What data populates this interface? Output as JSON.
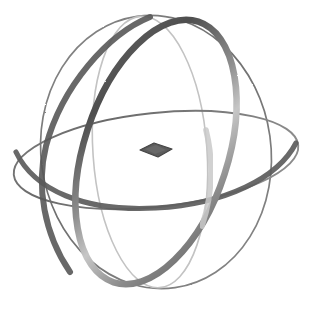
{
  "figure": {
    "background_color": "#ffffff",
    "width": 314,
    "height": 315,
    "center": {
      "x": 156,
      "y": 152
    }
  },
  "palette": {
    "background": "#ffffff",
    "thick_ring_dark": "#5a5a5a",
    "thick_ring_mid": "#7d7d7d",
    "thick_ring_light": "#b9b9b9",
    "outline_circle": "#7a7a7a",
    "faint_ring": "#c3c3c3",
    "equator_ring": "#6e6e6e",
    "center_marker": "#5b5b5b",
    "center_marker_edge": "#454545"
  },
  "elements": {
    "outer_sphere_outline": {
      "name": "Sphere silhouette",
      "kind": "ellipse",
      "cx": 156,
      "cy": 152,
      "rx": 115,
      "ry": 137,
      "rotation_deg": -8,
      "stroke": "#7a7a7a",
      "stroke_width": 1.6,
      "fill": "none"
    },
    "faint_meridian": {
      "name": "Faint meridian ring",
      "kind": "ellipse",
      "cx": 150,
      "cy": 152,
      "rx": 57,
      "ry": 136,
      "rotation_deg": -4,
      "stroke": "#c3c3c3",
      "stroke_width": 1.5,
      "fill": "none"
    },
    "thick_tilted_ring": {
      "name": "Thick tilted great circle",
      "kind": "ellipse",
      "cx": 156,
      "cy": 152,
      "rx": 72,
      "ry": 137,
      "rotation_deg": 18,
      "stroke_width": 6.5,
      "fill": "none",
      "gradient_stops": [
        {
          "offset": "0%",
          "color": "#616161"
        },
        {
          "offset": "22%",
          "color": "#4f4f4f"
        },
        {
          "offset": "46%",
          "color": "#8e8e8e"
        },
        {
          "offset": "60%",
          "color": "#c6c6c6"
        },
        {
          "offset": "78%",
          "color": "#8a8a8a"
        },
        {
          "offset": "100%",
          "color": "#5d5d5d"
        }
      ]
    },
    "equator_ring": {
      "name": "Equatorial ring",
      "kind": "ellipse",
      "cx": 156,
      "cy": 160,
      "rx": 144,
      "ry": 48,
      "rotation_deg": -6,
      "stroke": "#6e6e6e",
      "stroke_width": 2.0,
      "fill": "none"
    },
    "equator_ring_lower_arc": {
      "name": "Equatorial ring near edge (thickened)",
      "kind": "arc",
      "stroke": "#5d5d5d",
      "stroke_width": 5.0
    },
    "center_marker": {
      "name": "Center disc marker",
      "kind": "diamond",
      "cx": 156,
      "cy": 150,
      "half_width": 16,
      "half_height": 7,
      "fill": "#5b5b5b",
      "stroke": "#454545"
    }
  },
  "labels": {
    "figure_caption": "",
    "alt_text": "Wireframe sphere with three intersecting rings and a central flat marker"
  }
}
